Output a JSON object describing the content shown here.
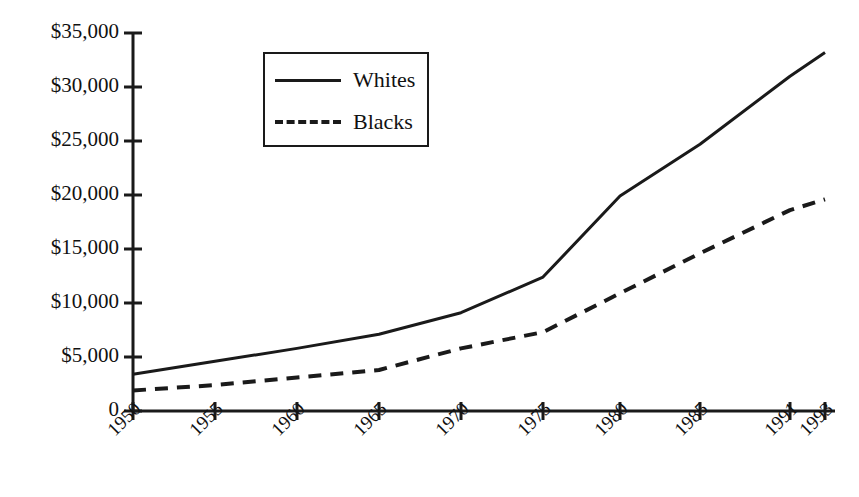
{
  "chart_data": {
    "type": "line",
    "title": "",
    "xlabel": "",
    "ylabel": "",
    "grid": false,
    "legend_position": "upper-left-inside",
    "categories": [
      "1950",
      "1955",
      "1960",
      "1965",
      "1970",
      "1975",
      "1980",
      "1985",
      "1991",
      "1993"
    ],
    "x_tick_labels": [
      "1950",
      "1955",
      "1960",
      "1965",
      "1970",
      "1975",
      "1980",
      "1985",
      "1991",
      "1993"
    ],
    "y_tick_labels": [
      "$35,000",
      "$30,000",
      "$25,000",
      "$20,000",
      "$15,000",
      "$10,000",
      "$5,000",
      "0"
    ],
    "y_tick_values": [
      35000,
      30000,
      25000,
      20000,
      15000,
      10000,
      5000,
      0
    ],
    "ylim": [
      0,
      35000
    ],
    "series": [
      {
        "name": "Whites",
        "style": "solid",
        "color": "#1a1a1a",
        "values": [
          3400,
          4600,
          5800,
          7100,
          9100,
          12400,
          19900,
          24700,
          31000,
          33200
        ]
      },
      {
        "name": "Blacks",
        "style": "dashed",
        "color": "#1a1a1a",
        "values": [
          1900,
          2400,
          3100,
          3800,
          5800,
          7300,
          10900,
          14600,
          18600,
          19600
        ]
      }
    ],
    "legend": [
      {
        "label": "Whites",
        "style": "solid"
      },
      {
        "label": "Blacks",
        "style": "dashed"
      }
    ]
  },
  "geometry": {
    "plot_left": 133,
    "plot_right": 835,
    "plot_top": 33,
    "plot_bottom": 411,
    "x_positions": [
      133,
      215,
      297,
      379,
      461,
      543,
      620,
      700,
      790,
      825
    ]
  }
}
